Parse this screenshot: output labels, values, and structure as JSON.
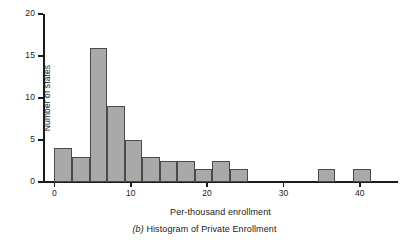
{
  "figure": {
    "caption_prefix": "(b)",
    "caption_text": "Histogram of Private Enrollment"
  },
  "chart_data": {
    "type": "bar",
    "title": "",
    "subtitle": "",
    "xlabel": "Per-thousand enrollment",
    "ylabel": "Number of states",
    "xlim": [
      -1.5,
      45
    ],
    "ylim": [
      0,
      20
    ],
    "xticks": [
      0,
      10,
      20,
      30,
      40
    ],
    "xtick_labels": [
      "0",
      "10",
      "20",
      "30",
      "40"
    ],
    "yticks": [
      0,
      5,
      10,
      15,
      20
    ],
    "ytick_labels": [
      "0",
      "5",
      "10",
      "15",
      "20"
    ],
    "grid": false,
    "legend": null,
    "bar_fill_color": "#a9a9a9",
    "bar_edge_color": "#4a4a4a",
    "axis_color": "#1c1c1c",
    "background_color": "#ffffff",
    "bin_width": 2.3,
    "bins": [
      {
        "label": "0 to 2.3",
        "x_start": 0.0,
        "x_end": 2.3,
        "value": 4
      },
      {
        "label": "2.3 to 4.6",
        "x_start": 2.3,
        "x_end": 4.6,
        "value": 3
      },
      {
        "label": "4.6 to 6.9",
        "x_start": 4.6,
        "x_end": 6.9,
        "value": 16
      },
      {
        "label": "6.9 to 9.2",
        "x_start": 6.9,
        "x_end": 9.2,
        "value": 9
      },
      {
        "label": "9.2 to 11.5",
        "x_start": 9.2,
        "x_end": 11.5,
        "value": 5
      },
      {
        "label": "11.5 to 13.8",
        "x_start": 11.5,
        "x_end": 13.8,
        "value": 3
      },
      {
        "label": "13.8 to 16.1",
        "x_start": 13.8,
        "x_end": 16.1,
        "value": 2.5
      },
      {
        "label": "16.1 to 18.4",
        "x_start": 16.1,
        "x_end": 18.4,
        "value": 2.5
      },
      {
        "label": "18.4 to 20.7",
        "x_start": 18.4,
        "x_end": 20.7,
        "value": 1.5
      },
      {
        "label": "20.7 to 23.0",
        "x_start": 20.7,
        "x_end": 23.0,
        "value": 2.5
      },
      {
        "label": "23.0 to 25.3",
        "x_start": 23.0,
        "x_end": 25.3,
        "value": 1.5
      },
      {
        "label": "34.5 to 36.8",
        "x_start": 34.5,
        "x_end": 36.8,
        "value": 1.5
      },
      {
        "label": "39.1 to 41.4",
        "x_start": 39.1,
        "x_end": 41.4,
        "value": 1.5
      }
    ]
  }
}
